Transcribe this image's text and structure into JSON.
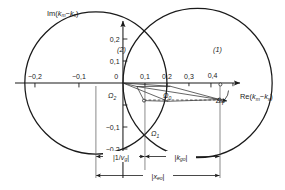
{
  "figure": {
    "type": "complex-plane-diagram",
    "background": "#ffffff",
    "ink_color": "#1a1a1a",
    "thin_color": "#555555"
  },
  "axes": {
    "x": {
      "name_parts": {
        "prefix": "Re(",
        "sym1": "k",
        "sub1": "m",
        "minus": "−",
        "sym2": "k",
        "sub2": "s",
        "suffix": ")"
      },
      "ticks": [
        "−0,2",
        "−0,1",
        "0",
        "0,1",
        "0,2",
        "0,3",
        "0,4"
      ],
      "tick_values": [
        -0.2,
        -0.1,
        0,
        0.1,
        0.2,
        0.3,
        0.4
      ],
      "range": [
        -0.245,
        0.43
      ]
    },
    "y": {
      "name_parts": {
        "prefix": "Im(",
        "sym1": "k",
        "sub1": "m",
        "minus": "−",
        "sym2": "k",
        "sub2": "s",
        "suffix": ")"
      },
      "ticks": [
        "0,2",
        "0,1",
        "−0,1",
        "−0,2"
      ],
      "tick_values": [
        0.2,
        0.1,
        -0.1,
        -0.2
      ],
      "range": [
        -0.225,
        0.235
      ]
    }
  },
  "circles": [
    {
      "id": "circle-2",
      "label": "(2)",
      "center_x": -0.0615,
      "center_y": 0.0,
      "radius": 0.1615,
      "label_x": 0.082,
      "label_y": 0.142
    },
    {
      "id": "circle-1",
      "label": "(1)",
      "center_x": 0.1695,
      "center_y": 0.0,
      "radius": 0.1695,
      "label_x": 0.3,
      "label_y": 0.142
    }
  ],
  "points": [
    {
      "id": "omega-2",
      "label": "Ω",
      "sub": "2",
      "x": 0.063,
      "y": -0.016,
      "label_x": 0.046,
      "label_y": -0.035
    },
    {
      "id": "omega-0",
      "label": "Ω",
      "sub": "0",
      "x": 0.216,
      "y": -0.015,
      "label_x": 0.2,
      "label_y": -0.035
    },
    {
      "id": "omega-1",
      "label": "Ω",
      "sub": "1",
      "x": 0.205,
      "y": -0.083,
      "label_x": 0.186,
      "label_y": -0.105
    }
  ],
  "annotations": {
    "delta_phi": {
      "label": "Δφ",
      "x": 0.352,
      "y": -0.045
    }
  },
  "dimensions": [
    {
      "id": "dim-inv-vg",
      "label_parts": {
        "bar_l": "|",
        "num": "1/",
        "sym": "v",
        "sub": "g",
        "bar_r": "|"
      },
      "from_x": -0.061,
      "to_x": 0.1,
      "y": -0.205
    },
    {
      "id": "dim-k-go",
      "label_parts": {
        "bar_l": "|",
        "sym": "k",
        "sub": "go",
        "bar_r": "|"
      },
      "from_x": 0.1,
      "to_x": 0.339,
      "y": -0.205
    },
    {
      "id": "dim-x-eo",
      "label_parts": {
        "bar_l": "|",
        "sym": "x",
        "sub": "eo",
        "bar_r": "|"
      },
      "from_x": -0.061,
      "to_x": 0.339,
      "y": -0.248
    }
  ]
}
